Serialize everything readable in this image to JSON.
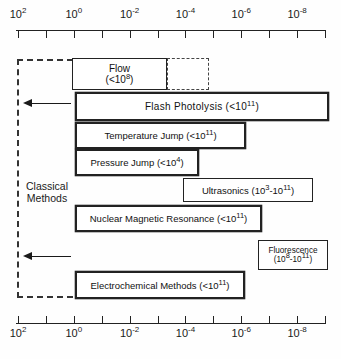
{
  "figure": {
    "classical_label": "Classical\nMethods",
    "classical_label_line1": "Classical",
    "classical_label_line2": "Methods"
  },
  "axis": {
    "type": "log",
    "orientation": "horizontal",
    "direction": "decreasing",
    "tick_exponents": [
      2,
      1,
      0,
      -1,
      -2,
      -3,
      -4,
      -5,
      -6,
      -7,
      -8,
      -9
    ],
    "labeled_exponents": [
      2,
      0,
      -2,
      -4,
      -6,
      -8
    ],
    "labels": [
      {
        "exponent": "2",
        "text": "10",
        "sup": "2"
      },
      {
        "exponent": "0",
        "text": "10",
        "sup": "0"
      },
      {
        "exponent": "-2",
        "text": "10",
        "sup": "-2"
      },
      {
        "exponent": "-4",
        "text": "10",
        "sup": "-4"
      },
      {
        "exponent": "-6",
        "text": "10",
        "sup": "-6"
      },
      {
        "exponent": "-8",
        "text": "10",
        "sup": "-8"
      }
    ],
    "top_axis": true,
    "bottom_axis": true
  },
  "methods": [
    {
      "id": "flow",
      "name": "Flow",
      "range_text": "(<10",
      "range_sup": "8",
      "range_close": ")",
      "label_line1": "Flow",
      "label_line2_pre": "(<10",
      "label_line2_sup": "8",
      "label_line2_post": ")",
      "border": "solid",
      "has_dashed_extension": true
    },
    {
      "id": "flash-photolysis",
      "name": "Flash Photolysis",
      "label_pre": "Flash Photolysis  (<10",
      "label_sup": "11",
      "label_post": ")",
      "border": "double"
    },
    {
      "id": "temperature-jump",
      "name": "Temperature Jump",
      "label_pre": "Temperature Jump (<10",
      "label_sup": "11",
      "label_post": ")",
      "border": "double"
    },
    {
      "id": "pressure-jump",
      "name": "Pressure Jump",
      "label_pre": "Pressure Jump (<10",
      "label_sup": "4",
      "label_post": ")",
      "border": "double"
    },
    {
      "id": "ultrasonics",
      "name": "Ultrasonics",
      "label_pre": "Ultrasonics (10",
      "label_sup": "3",
      "label_mid": "-10",
      "label_sup2": "11",
      "label_post": ")",
      "border": "solid"
    },
    {
      "id": "nuclear-magnetic-resonance",
      "name": "Nuclear Magnetic Resonance",
      "label_pre": "Nuclear Magnetic Resonance (<10",
      "label_sup": "11",
      "label_post": ")",
      "border": "double"
    },
    {
      "id": "fluorescence",
      "name": "Fluorescence",
      "label_line1": "Fluorescence",
      "label_line2_pre": "(10",
      "label_line2_sup": "8",
      "label_line2_mid": "-10",
      "label_line2_sup2": "11",
      "label_line2_post": ")",
      "border": "solid"
    },
    {
      "id": "electrochemical-methods",
      "name": "Electrochemical Methods",
      "label_pre": "Electrochemical Methods (<10",
      "label_sup": "11",
      "label_post": ")",
      "border": "double"
    }
  ],
  "colors": {
    "line": "#222222",
    "text": "#111111",
    "background": "#ffffff"
  }
}
